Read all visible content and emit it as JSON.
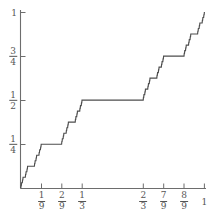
{
  "figure": {
    "title": "",
    "caption": ""
  },
  "chart_data": {
    "type": "line",
    "title": "",
    "subtitle": "",
    "xlabel": "",
    "ylabel": "",
    "xlim": [
      0,
      1
    ],
    "ylim": [
      0,
      1
    ],
    "grid": false,
    "legend": null,
    "x_ticks": [
      {
        "value": 0,
        "label": "",
        "num": "",
        "den": ""
      },
      {
        "value": 0.1111,
        "label": "1/9",
        "num": "1",
        "den": "9"
      },
      {
        "value": 0.2222,
        "label": "2/9",
        "num": "2",
        "den": "9"
      },
      {
        "value": 0.3333,
        "label": "1/3",
        "num": "1",
        "den": "3"
      },
      {
        "value": 0.6667,
        "label": "2/3",
        "num": "2",
        "den": "3"
      },
      {
        "value": 0.7778,
        "label": "7/9",
        "num": "7",
        "den": "9"
      },
      {
        "value": 0.8889,
        "label": "8/9",
        "num": "8",
        "den": "9"
      },
      {
        "value": 1,
        "label": "1",
        "num": "",
        "den": ""
      }
    ],
    "y_ticks": [
      {
        "value": 0.25,
        "label": "1/4",
        "num": "1",
        "den": "4"
      },
      {
        "value": 0.5,
        "label": "1/2",
        "num": "1",
        "den": "2"
      },
      {
        "value": 0.75,
        "label": "3/4",
        "num": "3",
        "den": "4"
      },
      {
        "value": 1,
        "label": "1",
        "num": "",
        "den": ""
      }
    ],
    "series": [
      {
        "name": "Cantor function",
        "color": "#4d4d4d",
        "plateaus": [
          {
            "x0": 0.1111,
            "x1": 0.2222,
            "y": 0.25
          },
          {
            "x0": 0.3333,
            "x1": 0.6667,
            "y": 0.5
          },
          {
            "x0": 0.7778,
            "x1": 0.8889,
            "y": 0.75
          }
        ]
      }
    ]
  },
  "axes": {
    "axis_color": "#6d6d6d",
    "curve_color": "#4d4d4d",
    "background": "#ffffff"
  }
}
